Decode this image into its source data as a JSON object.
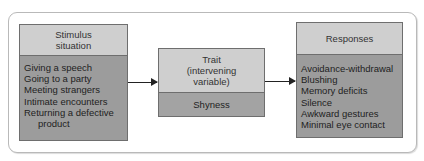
{
  "diagram": {
    "type": "flow",
    "nodes": [
      {
        "id": "stimulus",
        "header": [
          "Stimulus",
          "situation"
        ],
        "items": [
          "Giving a speech",
          "Going to a party",
          "Meeting strangers",
          "Intimate encounters",
          "Returning a defective",
          "product"
        ]
      },
      {
        "id": "trait",
        "header": [
          "Trait",
          "(intervening",
          "variable)"
        ],
        "items": [
          "Shyness"
        ]
      },
      {
        "id": "responses",
        "header": [
          "Responses"
        ],
        "items": [
          "Avoidance-withdrawal",
          "Blushing",
          "Memory deficits",
          "Silence",
          "Awkward gestures",
          "Minimal eye contact"
        ]
      }
    ],
    "edges": [
      {
        "from": "stimulus",
        "to": "trait"
      },
      {
        "from": "trait",
        "to": "responses"
      }
    ]
  },
  "colors": {
    "header_fill": "#cfcfcf",
    "body_fill": "#9c9c9c",
    "border": "#6e6e6e",
    "arrow": "#222222"
  }
}
